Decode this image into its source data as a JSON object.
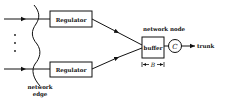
{
  "diagram": {
    "regulators": [
      {
        "label": "Regulator"
      },
      {
        "label": "Regulator"
      }
    ],
    "buffer": {
      "label": "buffer"
    },
    "server": {
      "label": "C"
    },
    "output": {
      "label": "trunk"
    },
    "node_label": "network node",
    "edge_label_line1": "network",
    "edge_label_line2": "edge",
    "dimension_label": "B",
    "colors": {
      "stroke": "#111111",
      "background": "#ffffff"
    }
  }
}
